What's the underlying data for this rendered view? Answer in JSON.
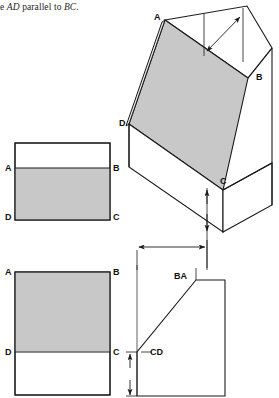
{
  "figure": {
    "caption": "e AD parallel to BC.",
    "caption_prefix": "e ",
    "caption_italic_1": "AD",
    "caption_mid": " parallel to ",
    "caption_italic_2": "BC",
    "caption_suffix": ".",
    "colors": {
      "face_gray": "#c8c8c8",
      "stroke": "#1a1a1a",
      "background": "#ffffff",
      "text": "#111111"
    }
  },
  "pictorial_view": {
    "name": "isometric-prism",
    "labels": [
      {
        "id": "A",
        "text": "A",
        "x": 154,
        "y": 13
      },
      {
        "id": "B",
        "text": "B",
        "x": 256,
        "y": 73
      },
      {
        "id": "C",
        "text": "C",
        "x": 220,
        "y": 177
      },
      {
        "id": "D",
        "text": "D",
        "x": 119,
        "y": 119
      }
    ],
    "dimension": {
      "name": "top-width-dimension",
      "style": "double-arrow",
      "value": ""
    }
  },
  "front_view_top": {
    "name": "upper-rectangle-view",
    "labels": [
      {
        "id": "A",
        "text": "A",
        "x": 5,
        "y": 164
      },
      {
        "id": "B",
        "text": "B",
        "x": 113,
        "y": 164
      },
      {
        "id": "D",
        "text": "D",
        "x": 5,
        "y": 213
      },
      {
        "id": "C",
        "text": "C",
        "x": 113,
        "y": 213
      }
    ],
    "shaded": "lower-portion"
  },
  "front_view_bottom": {
    "name": "lower-rectangle-view",
    "labels": [
      {
        "id": "A",
        "text": "A",
        "x": 5,
        "y": 268
      },
      {
        "id": "B",
        "text": "B",
        "x": 113,
        "y": 268
      },
      {
        "id": "D",
        "text": "D",
        "x": 5,
        "y": 348
      },
      {
        "id": "C",
        "text": "C",
        "x": 113,
        "y": 348
      }
    ],
    "shaded": "upper-portion"
  },
  "side_view": {
    "name": "profile-view",
    "labels": [
      {
        "id": "BA",
        "text": "BA",
        "x": 174,
        "y": 272
      },
      {
        "id": "CD",
        "text": "CD",
        "x": 150,
        "y": 348
      }
    ],
    "dimensions": [
      {
        "name": "horizontal-depth-dimension",
        "orientation": "horizontal",
        "value": ""
      },
      {
        "name": "vertical-height-dimension",
        "orientation": "vertical",
        "value": ""
      }
    ]
  }
}
